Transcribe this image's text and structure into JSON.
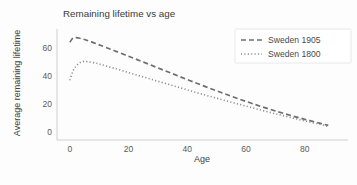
{
  "chart_data": {
    "type": "line",
    "title": "Remaining lifetime vs age",
    "xlabel": "Age",
    "ylabel": "Average remaining lifetime",
    "xlim": [
      -2,
      92
    ],
    "ylim": [
      -3,
      74
    ],
    "xticks": [
      0,
      20,
      40,
      60,
      80
    ],
    "yticks": [
      0,
      20,
      40,
      60
    ],
    "grid": false,
    "legend_position": "upper right",
    "x": [
      0,
      1,
      2,
      3,
      4,
      5,
      6,
      8,
      10,
      12,
      15,
      20,
      25,
      30,
      35,
      40,
      45,
      50,
      55,
      60,
      65,
      70,
      75,
      80,
      85,
      88
    ],
    "series": [
      {
        "name": "Sweden 1905",
        "linestyle": "dashed",
        "color": "#6e6e6e",
        "values": [
          64.5,
          67.4,
          67.8,
          67.5,
          67.0,
          66.4,
          65.7,
          64.2,
          62.6,
          61.0,
          58.5,
          54.4,
          50.2,
          46.0,
          41.8,
          37.6,
          33.5,
          29.5,
          25.6,
          21.9,
          18.3,
          15.0,
          11.9,
          9.0,
          6.3,
          4.6
        ]
      },
      {
        "name": "Sweden 1800",
        "linestyle": "dotted",
        "color": "#8a8a8a",
        "values": [
          37.2,
          43.5,
          47.0,
          49.2,
          50.3,
          50.6,
          50.5,
          49.8,
          48.8,
          47.6,
          45.8,
          42.6,
          39.5,
          36.4,
          33.3,
          30.2,
          27.1,
          24.2,
          21.3,
          18.5,
          15.7,
          13.0,
          10.4,
          7.9,
          5.5,
          3.9
        ]
      }
    ],
    "legend": [
      {
        "label": "Sweden 1905",
        "linestyle": "dashed"
      },
      {
        "label": "Sweden 1800",
        "linestyle": "dotted"
      }
    ]
  }
}
